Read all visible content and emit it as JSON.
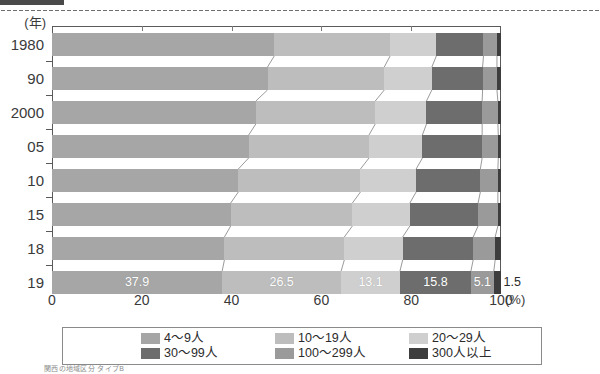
{
  "chart_data": {
    "type": "bar",
    "subtype": "stacked-100-horizontal",
    "title": "",
    "xlabel": "(%)",
    "ylabel": "(年)",
    "xlim": [
      0,
      100
    ],
    "xticks": [
      0,
      20,
      40,
      60,
      80,
      100
    ],
    "xticklabels": [
      "0",
      "20",
      "40",
      "60",
      "80",
      "100"
    ],
    "grid": false,
    "legend_position": "bottom",
    "categories": [
      "1980",
      "90",
      "2000",
      "05",
      "10",
      "15",
      "18",
      "19"
    ],
    "series": [
      {
        "name": "4～9人",
        "color": "#a6a6a6",
        "values": [
          49.5,
          48.0,
          45.4,
          43.8,
          41.5,
          39.8,
          38.4,
          37.9
        ]
      },
      {
        "name": "10～19人",
        "color": "#bdbdbd",
        "values": [
          25.8,
          26.0,
          26.6,
          26.8,
          27.2,
          27.1,
          26.7,
          26.5
        ]
      },
      {
        "name": "20～29人",
        "color": "#cfcfcf",
        "values": [
          10.3,
          10.6,
          11.4,
          11.9,
          12.4,
          12.8,
          13.0,
          13.1
        ]
      },
      {
        "name": "30～99人",
        "color": "#6d6d6d",
        "values": [
          10.5,
          11.3,
          12.4,
          13.3,
          14.3,
          15.2,
          15.7,
          15.8
        ]
      },
      {
        "name": "100～299人",
        "color": "#9a9a9a",
        "values": [
          3.0,
          3.2,
          3.5,
          3.6,
          3.9,
          4.4,
          4.9,
          5.1
        ]
      },
      {
        "name": "300人以上",
        "color": "#3d3d3d",
        "values": [
          0.9,
          0.9,
          0.7,
          0.6,
          0.7,
          0.7,
          1.3,
          1.5
        ]
      }
    ],
    "data_labels": {
      "row": "19",
      "values": [
        "37.9",
        "26.5",
        "13.1",
        "15.8",
        "5.1",
        "1.5"
      ]
    }
  },
  "axis": {
    "y_unit": "(年)",
    "x_unit": "(%)",
    "x_ticklabels": [
      "0",
      "20",
      "40",
      "60",
      "80",
      "100"
    ],
    "y_ticklabels": [
      "1980",
      "90",
      "2000",
      "05",
      "10",
      "15",
      "18",
      "19"
    ]
  },
  "legend": {
    "items": [
      {
        "label": "4～9人",
        "color": "#a6a6a6"
      },
      {
        "label": "10～19人",
        "color": "#bdbdbd"
      },
      {
        "label": "20～29人",
        "color": "#cfcfcf"
      },
      {
        "label": "30～99人",
        "color": "#6d6d6d"
      },
      {
        "label": "100～299人",
        "color": "#9a9a9a"
      },
      {
        "label": "300人以上",
        "color": "#3d3d3d"
      }
    ]
  },
  "footnote": {
    "text": "関西の地域区分 タイプB"
  }
}
